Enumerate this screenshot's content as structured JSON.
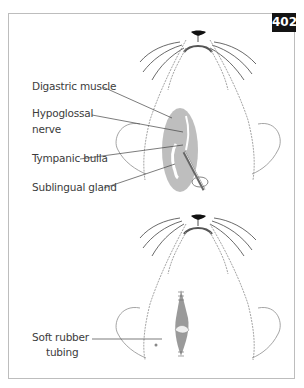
{
  "figure": {
    "number": "402",
    "top_panel": {
      "labels": [
        {
          "text": "Digastric muscle"
        },
        {
          "text": "Hypoglossal"
        },
        {
          "text": "nerve"
        },
        {
          "text": "Tympanic bulla"
        },
        {
          "text": "Sublingual gland"
        }
      ]
    },
    "bottom_panel": {
      "labels": [
        {
          "text": "Soft rubber"
        },
        {
          "text": "tubing"
        }
      ]
    }
  },
  "colors": {
    "badge_bg": "#141414",
    "badge_text": "#ffffff",
    "frame_border": "#bdbdbd",
    "label_text": "#3c3c3c",
    "tissue_gray": "#a8a8a8",
    "outline_gray": "#9a9a9a"
  }
}
